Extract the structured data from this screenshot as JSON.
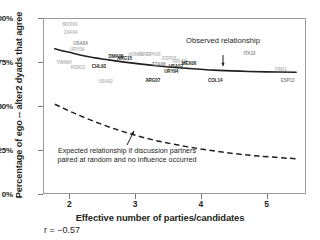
{
  "chart_data": {
    "type": "scatter",
    "title": "",
    "xlabel": "Effective number of parties/candidates",
    "ylabel": "Percentage of ego -- alter2 dyads that agree",
    "xlim": [
      1.6,
      5.6
    ],
    "ylim": [
      0,
      100
    ],
    "xticks": [
      "2",
      "3",
      "4",
      "5"
    ],
    "xtick_values": [
      2,
      3,
      4,
      5
    ],
    "yticks": [
      "0%",
      "25%",
      "50%",
      "75%",
      "100%"
    ],
    "ytick_values": [
      0,
      25,
      50,
      75,
      100
    ],
    "grid": false,
    "legend": "none",
    "correlation_label": "r = −0.57",
    "correlation_value": -0.57,
    "annotations": [
      {
        "name": "observed-relationship",
        "text": "Observed relationship",
        "x": 3.85,
        "y": 88
      },
      {
        "name": "expected-relationship",
        "text": "Expected relationship if discussion partners paired at random and no influence occurred",
        "x": 2.55,
        "y": 26
      }
    ],
    "series": [
      {
        "name": "Observed relationship",
        "type": "line",
        "style": "solid",
        "color": "#231f20",
        "points": [
          [
            1.78,
            82.5
          ],
          [
            2.0,
            80.5
          ],
          [
            2.3,
            78.0
          ],
          [
            2.6,
            76.2
          ],
          [
            3.0,
            74.2
          ],
          [
            3.4,
            72.6
          ],
          [
            3.8,
            71.4
          ],
          [
            4.2,
            70.4
          ],
          [
            4.6,
            69.8
          ],
          [
            5.0,
            69.4
          ],
          [
            5.45,
            69.2
          ]
        ]
      },
      {
        "name": "Expected relationship if random",
        "type": "line",
        "style": "dashed",
        "color": "#231f20",
        "points": [
          [
            1.78,
            51.0
          ],
          [
            2.1,
            45.5
          ],
          [
            2.5,
            39.5
          ],
          [
            2.9,
            34.5
          ],
          [
            3.3,
            30.5
          ],
          [
            3.7,
            27.5
          ],
          [
            4.1,
            25.0
          ],
          [
            4.5,
            23.0
          ],
          [
            4.9,
            21.5
          ],
          [
            5.45,
            20.0
          ]
        ]
      }
    ],
    "points": [
      {
        "label": "MOZ04",
        "x": 2.01,
        "y": 96.5,
        "shade": "faint"
      },
      {
        "label": "ZAF04",
        "x": 2.02,
        "y": 92.0,
        "shade": "faint"
      },
      {
        "label": "USA04",
        "x": 2.17,
        "y": 86.0,
        "shade": "mid"
      },
      {
        "label": "URY09",
        "x": 2.12,
        "y": 82.5,
        "shade": "faint"
      },
      {
        "label": "TWN04",
        "x": 1.92,
        "y": 75.0,
        "shade": "faint"
      },
      {
        "label": "KEN13",
        "x": 2.13,
        "y": 72.0,
        "shade": "faint"
      },
      {
        "label": "CHL93",
        "x": 2.45,
        "y": 72.5,
        "shade": "dark"
      },
      {
        "label": "DMA05",
        "x": 2.71,
        "y": 78.5,
        "shade": "dark"
      },
      {
        "label": "ARG15",
        "x": 2.84,
        "y": 77.5,
        "shade": "dark"
      },
      {
        "label": "HUN06",
        "x": 3.01,
        "y": 79.5,
        "shade": "faint"
      },
      {
        "label": "ISR03",
        "x": 3.15,
        "y": 79.5,
        "shade": "faint"
      },
      {
        "label": "CPV06",
        "x": 3.28,
        "y": 79.5,
        "shade": "faint"
      },
      {
        "label": "ESP03",
        "x": 3.52,
        "y": 77.5,
        "shade": "faint"
      },
      {
        "label": "HRU08",
        "x": 3.68,
        "y": 75.5,
        "shade": "faint"
      },
      {
        "label": "TZA08",
        "x": 3.36,
        "y": 74.0,
        "shade": "mid"
      },
      {
        "label": "MEX06",
        "x": 3.82,
        "y": 74.5,
        "shade": "dark"
      },
      {
        "label": "USA02",
        "x": 3.62,
        "y": 72.5,
        "shade": "dark"
      },
      {
        "label": "URY94",
        "x": 3.55,
        "y": 70.0,
        "shade": "dark"
      },
      {
        "label": "USA02",
        "x": 2.55,
        "y": 64.0,
        "shade": "faint"
      },
      {
        "label": "ARG07",
        "x": 3.27,
        "y": 64.5,
        "shade": "dark"
      },
      {
        "label": "COL14",
        "x": 4.22,
        "y": 64.5,
        "shade": "dark"
      },
      {
        "label": "ITA13",
        "x": 4.74,
        "y": 80.0,
        "shade": "mid"
      },
      {
        "label": "FIN11",
        "x": 5.22,
        "y": 71.0,
        "shade": "faint"
      },
      {
        "label": "ESP13",
        "x": 5.32,
        "y": 64.5,
        "shade": "mid"
      }
    ]
  }
}
